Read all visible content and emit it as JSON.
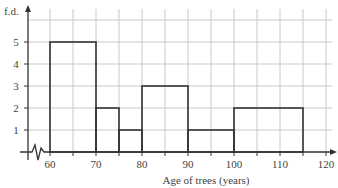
{
  "chart_data": {
    "type": "bar",
    "subtype": "histogram",
    "title": "",
    "xlabel": "Age of trees (years)",
    "ylabel": "f.d.",
    "xlim": [
      55,
      121
    ],
    "ylim": [
      0,
      6
    ],
    "x_ticks": [
      60,
      70,
      80,
      90,
      100,
      110,
      120
    ],
    "y_ticks": [
      1,
      2,
      3,
      4,
      5
    ],
    "grid": true,
    "axis_break": true,
    "bins": [
      {
        "from": 60,
        "to": 70,
        "fd": 5
      },
      {
        "from": 70,
        "to": 75,
        "fd": 2
      },
      {
        "from": 75,
        "to": 80,
        "fd": 1
      },
      {
        "from": 80,
        "to": 90,
        "fd": 3
      },
      {
        "from": 90,
        "to": 100,
        "fd": 1
      },
      {
        "from": 100,
        "to": 115,
        "fd": 2
      }
    ],
    "categories": [
      "60-70",
      "70-75",
      "75-80",
      "80-90",
      "90-100",
      "100-115"
    ],
    "values": [
      5,
      2,
      1,
      3,
      1,
      2
    ]
  },
  "style": {
    "grid_color": "#c8c8c8",
    "bar_stroke": "#333333",
    "axis_color": "#333333"
  }
}
